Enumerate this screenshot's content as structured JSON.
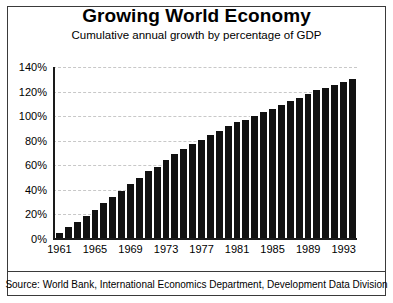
{
  "chart_data": {
    "type": "bar",
    "title": "Growing World Economy",
    "subtitle": "Cumulative annual growth by percentage of GDP",
    "xlabel": "",
    "ylabel": "",
    "ylim": [
      0,
      140
    ],
    "ytick_labels": [
      "0%",
      "20%",
      "40%",
      "60%",
      "80%",
      "100%",
      "120%",
      "140%"
    ],
    "ytick_values": [
      0,
      20,
      40,
      60,
      80,
      100,
      120,
      140
    ],
    "xtick_labels": [
      "1961",
      "1965",
      "1969",
      "1973",
      "1977",
      "1981",
      "1985",
      "1989",
      "1993"
    ],
    "xtick_values": [
      1961,
      1965,
      1969,
      1973,
      1977,
      1981,
      1985,
      1989,
      1993
    ],
    "grid": true,
    "legend": "none",
    "bar_color": "#111111",
    "categories": [
      "1961",
      "1962",
      "1963",
      "1964",
      "1965",
      "1966",
      "1967",
      "1968",
      "1969",
      "1970",
      "1971",
      "1972",
      "1973",
      "1974",
      "1975",
      "1976",
      "1977",
      "1978",
      "1979",
      "1980",
      "1981",
      "1982",
      "1983",
      "1984",
      "1985",
      "1986",
      "1987",
      "1988",
      "1989",
      "1990",
      "1991",
      "1992",
      "1993",
      "1994"
    ],
    "values": [
      5,
      10,
      14,
      19,
      24,
      29,
      34,
      39,
      45,
      50,
      55,
      59,
      64,
      69,
      73,
      77,
      81,
      85,
      88,
      92,
      95,
      97,
      100,
      103,
      106,
      109,
      112,
      115,
      118,
      121,
      123,
      125,
      128,
      130
    ],
    "source": "Source: World Bank, International Economics Department, Development Data Division"
  }
}
